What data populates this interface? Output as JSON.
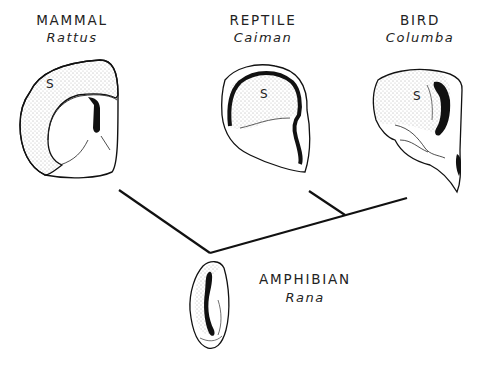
{
  "figure": {
    "taxa": [
      {
        "group": "MAMMAL",
        "species": "Rattus",
        "region_label": "S"
      },
      {
        "group": "REPTILE",
        "species": "Caiman",
        "region_label": "S"
      },
      {
        "group": "BIRD",
        "species": "Columba",
        "region_label": "S"
      },
      {
        "group": "AMPHIBIAN",
        "species": "Rana",
        "region_label": ""
      }
    ],
    "tree": {
      "description": "Cladogram: amphibian at root; mammal branch left; reptile and bird share a branch on the right"
    },
    "colors": {
      "ink": "#111111",
      "background": "#ffffff",
      "stipple": "#555555"
    }
  }
}
